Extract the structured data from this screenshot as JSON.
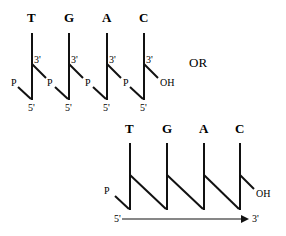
{
  "top_diagram": {
    "bases": [
      "T",
      "G",
      "A",
      "C"
    ],
    "prime3": "3'",
    "prime5": "5'",
    "phosphate": "P",
    "hydroxyl": "OH"
  },
  "separator": "OR",
  "bottom_diagram": {
    "bases": [
      "T",
      "G",
      "A",
      "C"
    ],
    "phosphate": "P",
    "hydroxyl": "OH",
    "start_label": "5'",
    "end_label": "3'"
  }
}
